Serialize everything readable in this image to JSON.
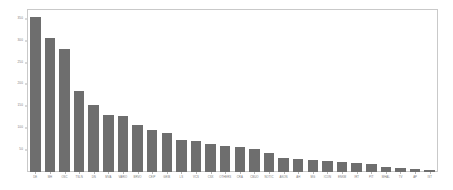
{
  "chart_data": {
    "type": "bar",
    "title": "",
    "subtitle": "",
    "xlabel": "",
    "ylabel": "",
    "grid": false,
    "legend": null,
    "bar_color": "#6e6e6e",
    "frame_color": "#c9c9c9",
    "tick_label_color": "#7a7a7a",
    "ylim": [
      0,
      370
    ],
    "yticks": [
      50,
      100,
      150,
      200,
      250,
      300,
      350
    ],
    "ytick_labels": [
      "50",
      "100",
      "150",
      "200",
      "250",
      "300",
      "350"
    ],
    "categories": [
      "DE",
      "MH",
      "OSC",
      "TSLN",
      "DN",
      "MVA",
      "VARIO",
      "BRVO",
      "CEIP",
      "GEIB",
      "LS",
      "VCS",
      "CSX",
      "OTHERS",
      "CRA",
      "CBUO",
      "NOTIC",
      "AKON",
      "AH",
      "MG",
      "ICON",
      "ENKM",
      "IRT",
      "PIT",
      "MHAL",
      "TV",
      "AP",
      "IST"
    ],
    "values": [
      355,
      307,
      282,
      186,
      154,
      130,
      128,
      108,
      97,
      90,
      74,
      70,
      64,
      60,
      56,
      52,
      44,
      32,
      30,
      28,
      26,
      24,
      21,
      18,
      12,
      10,
      6,
      5
    ]
  }
}
